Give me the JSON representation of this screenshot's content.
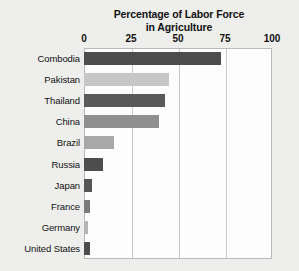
{
  "chart_data": {
    "type": "bar",
    "orientation": "horizontal",
    "title": "Percentage of Labor Force in Agriculture",
    "title_line1": "Percentage of Labor Force",
    "title_line2": "in Agriculture",
    "xlabel": "",
    "ylabel": "",
    "xlim": [
      0,
      100
    ],
    "xticks": [
      0,
      25,
      50,
      75,
      100
    ],
    "xtick_labels": [
      "0",
      "25",
      "50",
      "75",
      "100"
    ],
    "grid": true,
    "legend": false,
    "categories": [
      "Combodia",
      "Pakistan",
      "Thailand",
      "China",
      "Brazil",
      "Russia",
      "Japan",
      "France",
      "Germany",
      "United States"
    ],
    "values": [
      73,
      45,
      43,
      40,
      16,
      10,
      4,
      3,
      2,
      3
    ],
    "bar_colors": [
      "#4d4d4d",
      "#c6c6c6",
      "#595959",
      "#8f8f8f",
      "#a8a8a8",
      "#4d4d4d",
      "#555555",
      "#7a7a7a",
      "#b5b5b5",
      "#4d4d4d"
    ],
    "colors": {
      "background": "#eeeeec",
      "plot_background": "#fdfdfd",
      "gridline": "#c9c9c7",
      "frame": "#b9b9b7",
      "text": "#111111"
    }
  }
}
